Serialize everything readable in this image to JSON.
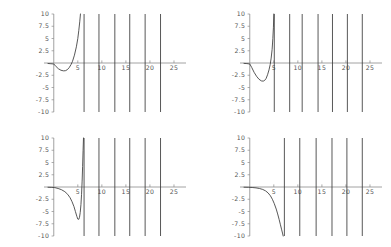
{
  "figure": {
    "type": "multi-panel-plot",
    "panel_count": 4,
    "layout": "2x2",
    "background": "#ffffff",
    "curve_color": "#3a3a3a",
    "axis_color": "#8a8a8a",
    "label_color": "#555555"
  },
  "axes_common": {
    "xlim": [
      -1.2,
      27.5
    ],
    "ylim": [
      -10,
      10
    ],
    "xticks": [
      5,
      10,
      15,
      20,
      25
    ],
    "xtick_labels": [
      "5",
      "10",
      "15",
      "20",
      "25"
    ],
    "yticks": [
      10,
      7.5,
      5,
      2.5,
      -2.5,
      -5,
      -7.5,
      -10
    ],
    "ytick_labels": [
      "10",
      "7.5",
      "5",
      "2.5",
      "-2.5",
      "-5",
      "-7.5",
      "-10"
    ],
    "grid": false,
    "legend": null,
    "title": "",
    "xlabel": "",
    "ylabel": ""
  },
  "chart_data": [
    {
      "id": "panel-top-left",
      "type": "line",
      "title": "",
      "xlabel": "",
      "ylabel": "",
      "xlim": [
        -1.2,
        27.5
      ],
      "ylim": [
        -10,
        10
      ],
      "xticks": [
        5,
        10,
        15,
        20,
        25
      ],
      "yticks": [
        10,
        7.5,
        5,
        2.5,
        -2.5,
        -5,
        -7.5,
        -10
      ],
      "grid": false,
      "asymptotes": [
        6.3,
        9.4,
        12.7,
        15.8,
        19.0,
        22.2
      ],
      "zero_crossings": [
        0.0,
        3.8
      ],
      "local_minimum": {
        "x": 2.2,
        "y": -1.6
      },
      "branch_points": [
        [
          -1.2,
          -0.1
        ],
        [
          -0.6,
          -0.15
        ],
        [
          0.0,
          -0.2
        ],
        [
          0.5,
          -0.75
        ],
        [
          1.0,
          -1.2
        ],
        [
          1.5,
          -1.48
        ],
        [
          2.0,
          -1.6
        ],
        [
          2.4,
          -1.58
        ],
        [
          2.8,
          -1.38
        ],
        [
          3.2,
          -0.95
        ],
        [
          3.6,
          -0.3
        ],
        [
          3.9,
          0.35
        ],
        [
          4.3,
          1.6
        ],
        [
          4.7,
          3.3
        ],
        [
          5.0,
          5.0
        ],
        [
          5.2,
          6.6
        ],
        [
          5.4,
          8.4
        ],
        [
          5.55,
          10.0
        ]
      ]
    },
    {
      "id": "panel-top-right",
      "type": "line",
      "title": "",
      "xlabel": "",
      "ylabel": "",
      "xlim": [
        -1.2,
        27.5
      ],
      "ylim": [
        -10,
        10
      ],
      "xticks": [
        5,
        10,
        15,
        20,
        25
      ],
      "yticks": [
        10,
        7.5,
        5,
        2.5,
        -2.5,
        -5,
        -7.5,
        -10
      ],
      "grid": false,
      "asymptotes": [
        5.1,
        8.3,
        10.9,
        14.2,
        17.2,
        20.3,
        23.4
      ],
      "zero_crossings": [
        0.0,
        4.4
      ],
      "local_minimum": {
        "x": 2.7,
        "y": -3.7
      },
      "branch_points": [
        [
          -1.2,
          -0.08
        ],
        [
          -0.6,
          -0.12
        ],
        [
          0.0,
          -0.2
        ],
        [
          0.4,
          -0.9
        ],
        [
          0.9,
          -1.9
        ],
        [
          1.4,
          -2.7
        ],
        [
          1.9,
          -3.3
        ],
        [
          2.4,
          -3.65
        ],
        [
          2.8,
          -3.7
        ],
        [
          3.1,
          -3.55
        ],
        [
          3.4,
          -3.15
        ],
        [
          3.7,
          -2.4
        ],
        [
          4.0,
          -1.4
        ],
        [
          4.25,
          -0.3
        ],
        [
          4.45,
          1.0
        ],
        [
          4.65,
          2.8
        ],
        [
          4.8,
          5.0
        ],
        [
          4.92,
          7.3
        ],
        [
          5.0,
          10.0
        ]
      ]
    },
    {
      "id": "panel-bottom-left",
      "type": "line",
      "title": "",
      "xlabel": "",
      "ylabel": "",
      "xlim": [
        -1.2,
        27.5
      ],
      "ylim": [
        -10,
        10
      ],
      "xticks": [
        5,
        10,
        15,
        20,
        25
      ],
      "yticks": [
        10,
        7.5,
        5,
        2.5,
        -2.5,
        -5,
        -7.5,
        -10
      ],
      "grid": false,
      "asymptotes": [
        6.3,
        9.4,
        12.7,
        15.8,
        19.0,
        22.2
      ],
      "zero_crossings": [
        0.0,
        5.85
      ],
      "local_minimum": {
        "x": 5.0,
        "y": -6.6
      },
      "branch_points": [
        [
          -1.2,
          -0.05
        ],
        [
          -0.4,
          -0.08
        ],
        [
          0.2,
          -0.12
        ],
        [
          0.9,
          -0.3
        ],
        [
          1.6,
          -0.55
        ],
        [
          2.3,
          -0.95
        ],
        [
          2.9,
          -1.5
        ],
        [
          3.4,
          -2.2
        ],
        [
          3.8,
          -3.0
        ],
        [
          4.2,
          -4.0
        ],
        [
          4.5,
          -5.0
        ],
        [
          4.8,
          -6.0
        ],
        [
          5.0,
          -6.55
        ],
        [
          5.2,
          -6.6
        ],
        [
          5.35,
          -6.2
        ],
        [
          5.5,
          -5.2
        ],
        [
          5.65,
          -3.6
        ],
        [
          5.78,
          -1.5
        ],
        [
          5.9,
          1.2
        ],
        [
          6.0,
          4.2
        ],
        [
          6.1,
          7.5
        ],
        [
          6.18,
          10.0
        ]
      ]
    },
    {
      "id": "panel-bottom-right",
      "type": "line",
      "title": "",
      "xlabel": "",
      "ylabel": "",
      "xlim": [
        -1.2,
        27.5
      ],
      "ylim": [
        -10,
        10
      ],
      "xticks": [
        5,
        10,
        15,
        20,
        25
      ],
      "yticks": [
        10,
        7.5,
        5,
        2.5,
        -2.5,
        -5,
        -7.5,
        -10
      ],
      "grid": false,
      "asymptotes": [
        7.2,
        10.4,
        13.8,
        17.1,
        20.2,
        23.4
      ],
      "zero_crossings": [
        0.0
      ],
      "local_minimum": null,
      "branch_points": [
        [
          -1.2,
          -0.04
        ],
        [
          -0.3,
          -0.06
        ],
        [
          0.5,
          -0.1
        ],
        [
          1.3,
          -0.18
        ],
        [
          2.0,
          -0.3
        ],
        [
          2.7,
          -0.5
        ],
        [
          3.3,
          -0.8
        ],
        [
          3.8,
          -1.2
        ],
        [
          4.3,
          -1.8
        ],
        [
          4.7,
          -2.5
        ],
        [
          5.1,
          -3.4
        ],
        [
          5.5,
          -4.5
        ],
        [
          5.8,
          -5.5
        ],
        [
          6.1,
          -6.6
        ],
        [
          6.35,
          -7.6
        ],
        [
          6.6,
          -8.6
        ],
        [
          6.8,
          -9.4
        ],
        [
          6.95,
          -10.0
        ]
      ]
    }
  ]
}
